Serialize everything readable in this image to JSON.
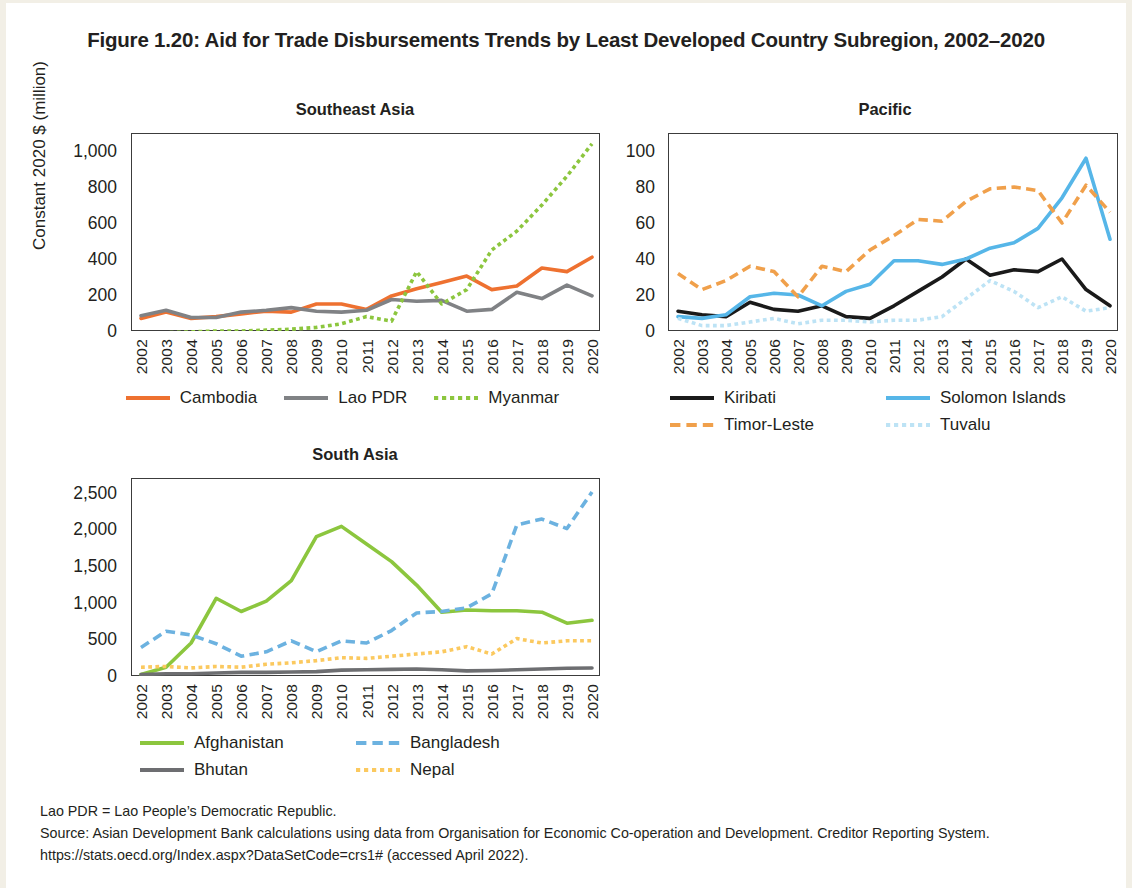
{
  "figure": {
    "title": "Figure 1.20: Aid for Trade Disbursements Trends by Least Developed Country Subregion, 2002–2020",
    "y_axis_label": "Constant 2020 $ (million)"
  },
  "notes": {
    "abbreviation": "Lao PDR = Lao People’s Democratic Republic.",
    "source": "Source: Asian Development Bank calculations using data from Organisation for Economic Co-operation and Development. Creditor Reporting System. https://stats.oecd.org/Index.aspx?DataSetCode=crs1# (accessed April 2022)."
  },
  "colors": {
    "cambodia": "#ee7130",
    "lao_pdr": "#808285",
    "myanmar": "#8cc63e",
    "kiribati": "#1a1a1a",
    "solomon_islands": "#56b6e8",
    "timor_leste": "#f0a04b",
    "tuvalu": "#bde3f5",
    "afghanistan": "#8cc63e",
    "bangladesh": "#6cb2e0",
    "bhutan": "#6d6e71",
    "nepal": "#fbc95f",
    "axis": "#3c3c3c",
    "text": "#231f20"
  },
  "chart_data": [
    {
      "id": "southeast_asia",
      "type": "line",
      "title": "Southeast Asia",
      "xlabel": "",
      "ylabel": "Constant 2020 $ (million)",
      "x": [
        "2002",
        "2003",
        "2004",
        "2005",
        "2006",
        "2007",
        "2008",
        "2009",
        "2010",
        "2011",
        "2012",
        "2013",
        "2014",
        "2015",
        "2016",
        "2017",
        "2018",
        "2019",
        "2020"
      ],
      "ylim": [
        0,
        1100
      ],
      "yticks": [
        0,
        200,
        400,
        600,
        800,
        1000
      ],
      "ytick_labels": [
        "0",
        "200",
        "400",
        "600",
        "800",
        "1,000"
      ],
      "grid": false,
      "legend_position": "bottom",
      "series": [
        {
          "name": "Cambodia",
          "style": "solid",
          "color": "#ee7130",
          "values": [
            70,
            105,
            70,
            80,
            95,
            110,
            105,
            150,
            150,
            120,
            195,
            235,
            270,
            305,
            230,
            250,
            350,
            330,
            410
          ]
        },
        {
          "name": "Lao PDR",
          "style": "solid",
          "color": "#808285",
          "values": [
            85,
            115,
            75,
            75,
            105,
            115,
            130,
            110,
            105,
            115,
            175,
            165,
            170,
            110,
            120,
            215,
            180,
            255,
            195
          ]
        },
        {
          "name": "Myanmar",
          "style": "dotted",
          "color": "#8cc63e",
          "values": [
            -15,
            -10,
            -5,
            0,
            0,
            5,
            10,
            20,
            40,
            80,
            55,
            330,
            150,
            230,
            450,
            555,
            700,
            860,
            1040
          ]
        }
      ]
    },
    {
      "id": "pacific",
      "type": "line",
      "title": "Pacific",
      "xlabel": "",
      "ylabel": "Constant 2020 $ (million)",
      "x": [
        "2002",
        "2003",
        "2004",
        "2005",
        "2006",
        "2007",
        "2008",
        "2009",
        "2010",
        "2011",
        "2012",
        "2013",
        "2014",
        "2015",
        "2016",
        "2017",
        "2018",
        "2019",
        "2020"
      ],
      "ylim": [
        0,
        110
      ],
      "yticks": [
        0,
        20,
        40,
        60,
        80,
        100
      ],
      "ytick_labels": [
        "0",
        "20",
        "40",
        "60",
        "80",
        "100"
      ],
      "grid": false,
      "legend_position": "bottom",
      "series": [
        {
          "name": "Kiribati",
          "style": "solid",
          "color": "#1a1a1a",
          "values": [
            11,
            9,
            8,
            16,
            12,
            11,
            14,
            8,
            7,
            14,
            22,
            30,
            40,
            31,
            34,
            33,
            40,
            23,
            14
          ]
        },
        {
          "name": "Solomon Islands",
          "style": "solid",
          "color": "#56b6e8",
          "values": [
            8,
            7,
            9,
            19,
            21,
            20,
            14,
            22,
            26,
            39,
            39,
            37,
            40,
            46,
            49,
            57,
            74,
            96,
            51
          ]
        },
        {
          "name": "Timor-Leste",
          "style": "dashed",
          "color": "#f0a04b",
          "values": [
            32,
            23,
            28,
            36,
            33,
            19,
            36,
            33,
            45,
            53,
            62,
            61,
            72,
            79,
            80,
            78,
            60,
            81,
            66
          ]
        },
        {
          "name": "Tuvalu",
          "style": "dotted",
          "color": "#bde3f5",
          "values": [
            7,
            3,
            3,
            5,
            7,
            4,
            6,
            6,
            5,
            6,
            6,
            8,
            18,
            28,
            22,
            13,
            19,
            11,
            13
          ]
        }
      ]
    },
    {
      "id": "south_asia",
      "type": "line",
      "title": "South Asia",
      "xlabel": "",
      "ylabel": "Constant 2020 $ (million)",
      "x": [
        "2002",
        "2003",
        "2004",
        "2005",
        "2006",
        "2007",
        "2008",
        "2009",
        "2010",
        "2011",
        "2012",
        "2013",
        "2014",
        "2015",
        "2016",
        "2017",
        "2018",
        "2019",
        "2020"
      ],
      "ylim": [
        0,
        2700
      ],
      "yticks": [
        0,
        500,
        1000,
        1500,
        2000,
        2500
      ],
      "ytick_labels": [
        "0",
        "500",
        "1,000",
        "1,500",
        "2,000",
        "2,500"
      ],
      "grid": false,
      "legend_position": "bottom",
      "series": [
        {
          "name": "Afghanistan",
          "style": "solid",
          "color": "#8cc63e",
          "values": [
            20,
            120,
            450,
            1060,
            880,
            1020,
            1300,
            1900,
            2040,
            1800,
            1560,
            1240,
            870,
            900,
            890,
            890,
            870,
            720,
            760
          ]
        },
        {
          "name": "Bangladesh",
          "style": "dashed",
          "color": "#6cb2e0",
          "values": [
            390,
            610,
            560,
            440,
            270,
            330,
            480,
            330,
            480,
            450,
            620,
            860,
            880,
            930,
            1120,
            2060,
            2140,
            2010,
            2510
          ]
        },
        {
          "name": "Bhutan",
          "style": "solid",
          "color": "#6d6e71",
          "values": [
            20,
            30,
            30,
            40,
            50,
            50,
            55,
            60,
            80,
            85,
            90,
            95,
            85,
            70,
            75,
            85,
            95,
            105,
            110
          ]
        },
        {
          "name": "Nepal",
          "style": "dotted",
          "color": "#fbc95f",
          "values": [
            120,
            130,
            110,
            130,
            120,
            160,
            180,
            210,
            250,
            240,
            270,
            300,
            330,
            400,
            300,
            510,
            450,
            480,
            480
          ]
        }
      ]
    }
  ],
  "legends": {
    "southeast_asia": [
      {
        "label": "Cambodia",
        "color": "#ee7130",
        "style": "solid"
      },
      {
        "label": "Lao PDR",
        "color": "#808285",
        "style": "solid"
      },
      {
        "label": "Myanmar",
        "color": "#8cc63e",
        "style": "dotted"
      }
    ],
    "pacific": [
      {
        "label": "Kiribati",
        "color": "#1a1a1a",
        "style": "solid"
      },
      {
        "label": "Solomon Islands",
        "color": "#56b6e8",
        "style": "solid"
      },
      {
        "label": "Timor-Leste",
        "color": "#f0a04b",
        "style": "dashed"
      },
      {
        "label": "Tuvalu",
        "color": "#bde3f5",
        "style": "dotted"
      }
    ],
    "south_asia": [
      {
        "label": "Afghanistan",
        "color": "#8cc63e",
        "style": "solid"
      },
      {
        "label": "Bangladesh",
        "color": "#6cb2e0",
        "style": "dashed"
      },
      {
        "label": "Bhutan",
        "color": "#6d6e71",
        "style": "solid"
      },
      {
        "label": "Nepal",
        "color": "#fbc95f",
        "style": "dotted"
      }
    ]
  }
}
